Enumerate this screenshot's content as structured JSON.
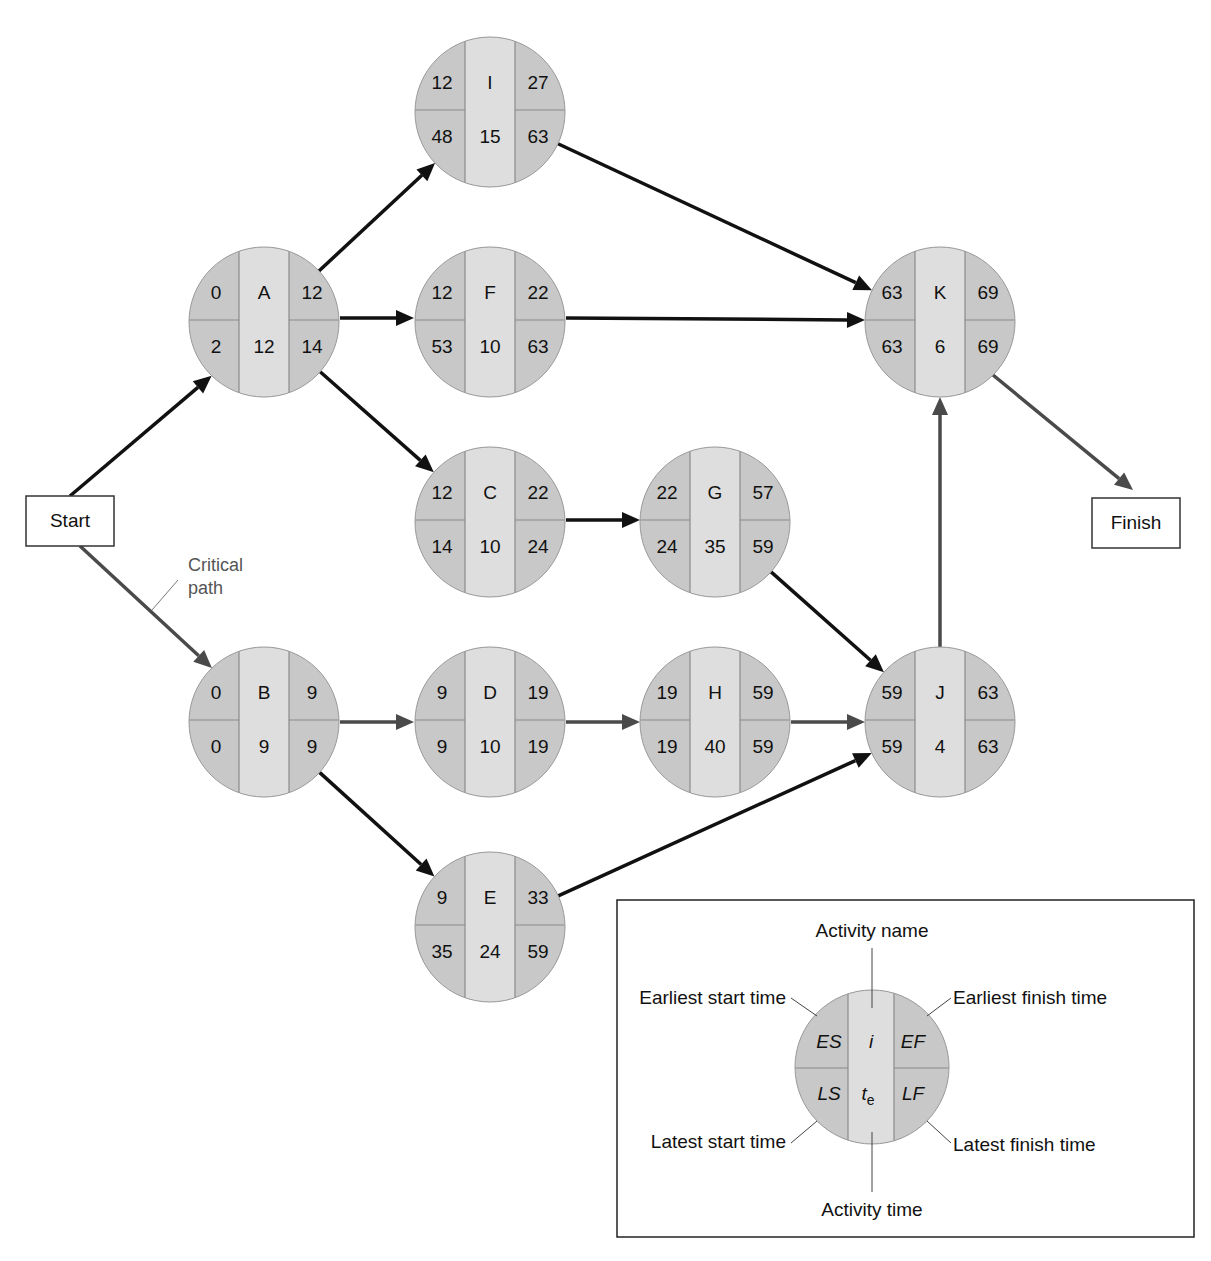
{
  "diagram": {
    "start_label": "Start",
    "finish_label": "Finish",
    "critical_path_label_line1": "Critical",
    "critical_path_label_line2": "path",
    "colors": {
      "outer_fill": "#c8c8c8",
      "center_fill": "#dedede",
      "divider": "#8a8a8a",
      "normal_arrow": "#111111",
      "critical_arrow": "#4a4a4a"
    },
    "nodes": [
      {
        "id": "I",
        "name": "I",
        "es": "12",
        "ef": "27",
        "ls": "48",
        "te": "15",
        "lf": "63",
        "cx": 490,
        "cy": 112
      },
      {
        "id": "A",
        "name": "A",
        "es": "0",
        "ef": "12",
        "ls": "2",
        "te": "12",
        "lf": "14",
        "cx": 264,
        "cy": 322
      },
      {
        "id": "F",
        "name": "F",
        "es": "12",
        "ef": "22",
        "ls": "53",
        "te": "10",
        "lf": "63",
        "cx": 490,
        "cy": 322
      },
      {
        "id": "K",
        "name": "K",
        "es": "63",
        "ef": "69",
        "ls": "63",
        "te": "6",
        "lf": "69",
        "cx": 940,
        "cy": 322
      },
      {
        "id": "C",
        "name": "C",
        "es": "12",
        "ef": "22",
        "ls": "14",
        "te": "10",
        "lf": "24",
        "cx": 490,
        "cy": 522
      },
      {
        "id": "G",
        "name": "G",
        "es": "22",
        "ef": "57",
        "ls": "24",
        "te": "35",
        "lf": "59",
        "cx": 715,
        "cy": 522
      },
      {
        "id": "B",
        "name": "B",
        "es": "0",
        "ef": "9",
        "ls": "0",
        "te": "9",
        "lf": "9",
        "cx": 264,
        "cy": 722
      },
      {
        "id": "D",
        "name": "D",
        "es": "9",
        "ef": "19",
        "ls": "9",
        "te": "10",
        "lf": "19",
        "cx": 490,
        "cy": 722
      },
      {
        "id": "H",
        "name": "H",
        "es": "19",
        "ef": "59",
        "ls": "19",
        "te": "40",
        "lf": "59",
        "cx": 715,
        "cy": 722
      },
      {
        "id": "J",
        "name": "J",
        "es": "59",
        "ef": "63",
        "ls": "59",
        "te": "4",
        "lf": "63",
        "cx": 940,
        "cy": 722
      },
      {
        "id": "E",
        "name": "E",
        "es": "9",
        "ef": "33",
        "ls": "35",
        "te": "24",
        "lf": "59",
        "cx": 490,
        "cy": 927
      }
    ],
    "edges": [
      {
        "from": "Start",
        "to": "A",
        "critical": false
      },
      {
        "from": "Start",
        "to": "B",
        "critical": true
      },
      {
        "from": "A",
        "to": "I",
        "critical": false
      },
      {
        "from": "A",
        "to": "F",
        "critical": false
      },
      {
        "from": "A",
        "to": "C",
        "critical": false
      },
      {
        "from": "I",
        "to": "K",
        "critical": false
      },
      {
        "from": "F",
        "to": "K",
        "critical": false
      },
      {
        "from": "C",
        "to": "G",
        "critical": false
      },
      {
        "from": "G",
        "to": "J",
        "critical": false
      },
      {
        "from": "B",
        "to": "D",
        "critical": true
      },
      {
        "from": "B",
        "to": "E",
        "critical": false
      },
      {
        "from": "D",
        "to": "H",
        "critical": true
      },
      {
        "from": "H",
        "to": "J",
        "critical": true
      },
      {
        "from": "E",
        "to": "J",
        "critical": false
      },
      {
        "from": "J",
        "to": "K",
        "critical": true
      },
      {
        "from": "K",
        "to": "Finish",
        "critical": true
      }
    ]
  },
  "legend": {
    "activity_name": "Activity name",
    "earliest_start": "Earliest start time",
    "earliest_finish": "Earliest finish time",
    "latest_start": "Latest start time",
    "latest_finish": "Latest finish time",
    "activity_time": "Activity time",
    "es": "ES",
    "ef": "EF",
    "ls": "LS",
    "lf": "LF",
    "i": "i",
    "te_main": "t",
    "te_sub": "e"
  }
}
